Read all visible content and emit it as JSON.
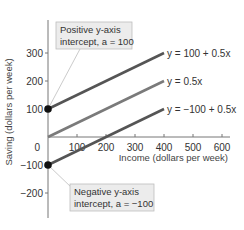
{
  "chart_data": {
    "type": "line",
    "title": "",
    "xlabel": "Income (dollars per week)",
    "ylabel": "Saving (dollars per week)",
    "xlim": [
      0,
      650
    ],
    "ylim": [
      -250,
      400
    ],
    "x_ticks": [
      100,
      200,
      300,
      400,
      500,
      600
    ],
    "y_ticks": [
      -200,
      -100,
      0,
      100,
      200,
      300
    ],
    "origin_label": "0",
    "grid": false,
    "series": [
      {
        "name": "y = 100 + 0.5x",
        "label": "y = 100 + 0.5x",
        "x": [
          0,
          400
        ],
        "values": [
          100,
          300
        ],
        "intercept": 100,
        "slope": 0.5,
        "color": "#555555",
        "marker_at_intercept": true
      },
      {
        "name": "y = 0.5x",
        "label": "y = 0.5x",
        "x": [
          0,
          400
        ],
        "values": [
          0,
          200
        ],
        "intercept": 0,
        "slope": 0.5,
        "color": "#7a7a7a",
        "marker_at_intercept": false
      },
      {
        "name": "y = -100 + 0.5x",
        "label": "y = −100 + 0.5x",
        "x": [
          0,
          400
        ],
        "values": [
          -100,
          100
        ],
        "intercept": -100,
        "slope": 0.5,
        "color": "#555555",
        "marker_at_intercept": true
      }
    ],
    "annotations": [
      {
        "line1": "Positive y-axis",
        "line2": "intercept, a = 100",
        "target": [
          0,
          100
        ]
      },
      {
        "line1": "Negative y-axis",
        "line2": "intercept, a = −100",
        "target": [
          0,
          -100
        ]
      }
    ]
  }
}
